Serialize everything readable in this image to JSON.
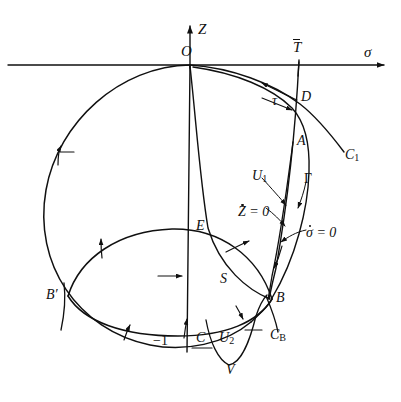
{
  "figure": {
    "kind": "phase-plane-diagram",
    "background_color": "#ffffff",
    "ink_color": "#101010",
    "width": 401,
    "height": 402
  },
  "axes": {
    "vertical": {
      "label": "Z",
      "x": 190,
      "top_y": 22,
      "bottom_y": 352
    },
    "horizontal": {
      "label": "σ",
      "y": 65,
      "left_x": 8,
      "right_x": 392
    },
    "origin_label": "O",
    "tick_labels": [
      {
        "text": "−1",
        "x": 155,
        "y": 336
      }
    ]
  },
  "labels": [
    {
      "id": "Z-axis",
      "text": "Z",
      "x": 198,
      "y": 22,
      "size": "sz-lg",
      "style": "italic"
    },
    {
      "id": "sigma-axis",
      "text": "σ",
      "x": 364,
      "y": 47,
      "size": "sz-lg",
      "style": "italic"
    },
    {
      "id": "origin",
      "text": "O",
      "x": 181,
      "y": 44,
      "size": "sz-lg",
      "style": "italic"
    },
    {
      "id": "T-bar",
      "text": "T",
      "x": 294,
      "y": 40,
      "size": "sz-lg",
      "style": "bar"
    },
    {
      "id": "D",
      "text": "D",
      "x": 301,
      "y": 90,
      "size": "sz-md",
      "style": "italic"
    },
    {
      "id": "tau",
      "text": "τ",
      "x": 272,
      "y": 93,
      "size": "sz-md",
      "style": "italic"
    },
    {
      "id": "A",
      "text": "A",
      "x": 297,
      "y": 134,
      "size": "sz-md",
      "style": "italic"
    },
    {
      "id": "C1",
      "text": "C",
      "x": 345,
      "y": 148,
      "size": "sz-md",
      "style": "sub1"
    },
    {
      "id": "U1",
      "text": "U",
      "x": 252,
      "y": 168,
      "size": "sz-md",
      "style": "sub1"
    },
    {
      "id": "Gamma",
      "text": "Γ",
      "x": 306,
      "y": 172,
      "size": "sz-md",
      "style": "upright"
    },
    {
      "id": "Zdot-zero",
      "text": "Z = 0",
      "x": 238,
      "y": 206,
      "size": "sz-md",
      "style": "dot"
    },
    {
      "id": "sigmadot-zero",
      "text": "σ = 0",
      "x": 308,
      "y": 226,
      "size": "sz-md",
      "style": "dot"
    },
    {
      "id": "E",
      "text": "E",
      "x": 196,
      "y": 219,
      "size": "sz-md",
      "style": "italic"
    },
    {
      "id": "S",
      "text": "S",
      "x": 220,
      "y": 272,
      "size": "sz-md",
      "style": "italic"
    },
    {
      "id": "B-prime",
      "text": "B′",
      "x": 50,
      "y": 288,
      "size": "sz-md",
      "style": "italic"
    },
    {
      "id": "B",
      "text": "B",
      "x": 276,
      "y": 291,
      "size": "sz-md",
      "style": "italic"
    },
    {
      "id": "CB",
      "text": "C",
      "x": 272,
      "y": 327,
      "size": "sz-md",
      "style": "subB"
    },
    {
      "id": "C",
      "text": "C",
      "x": 197,
      "y": 330,
      "size": "sz-md",
      "style": "italic"
    },
    {
      "id": "U2",
      "text": "U",
      "x": 220,
      "y": 330,
      "size": "sz-md",
      "style": "sub2"
    },
    {
      "id": "V",
      "text": "V",
      "x": 227,
      "y": 362,
      "size": "sz-md",
      "style": "italic"
    }
  ],
  "curves": [
    {
      "id": "big-circle",
      "name": "C_B large circle through O"
    },
    {
      "id": "lens-upper",
      "name": "S region upper boundary E-arc"
    },
    {
      "id": "lens-lower",
      "name": "S region lower boundary through -1"
    },
    {
      "id": "C1-curve",
      "name": "C1 trajectory from O to lower right"
    },
    {
      "id": "Gamma-curve",
      "name": "Gamma arc from D through A to B"
    },
    {
      "id": "U1-curve",
      "name": "U1 narrow sliver A to B"
    },
    {
      "id": "Zdot-curve",
      "name": "Z-dot = 0 isocline through O to B"
    },
    {
      "id": "sigmadot-curve",
      "name": "sigma-dot = 0 isocline vertical through T-bar"
    },
    {
      "id": "U2-curve",
      "name": "U2 V-shaped curve through V"
    },
    {
      "id": "CB-tail",
      "name": "C_B tail below B"
    },
    {
      "id": "Bprime-tail",
      "name": "tail below B prime"
    }
  ],
  "direction_arrows": [
    {
      "id": "arrow-circle-upper-left",
      "x": 62,
      "y": 152
    },
    {
      "id": "arrow-lens-upper-left",
      "x": 100,
      "y": 248
    },
    {
      "id": "arrow-lens-upper-right",
      "x": 235,
      "y": 245
    },
    {
      "id": "arrow-lens-interior",
      "x": 170,
      "y": 275
    },
    {
      "id": "arrow-lens-lower-left",
      "x": 128,
      "y": 330
    },
    {
      "id": "arrow-lens-lower-mid",
      "x": 186,
      "y": 327
    },
    {
      "id": "arrow-circle-lower-right",
      "x": 241,
      "y": 313
    },
    {
      "id": "arrow-tau-upper",
      "x": 268,
      "y": 86
    },
    {
      "id": "arrow-tau-lower",
      "x": 272,
      "y": 106
    }
  ]
}
